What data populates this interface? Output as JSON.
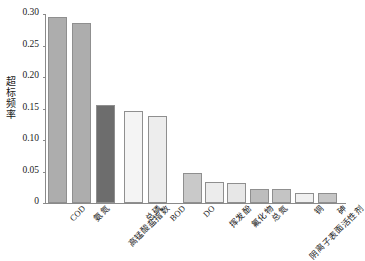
{
  "chart_data": {
    "type": "bar",
    "title": "",
    "xlabel": "",
    "ylabel": "超标频率",
    "ylim": [
      0,
      0.3
    ],
    "grid": false,
    "legend": "none",
    "ytick_labels": [
      "0.30",
      "0.25",
      "0.20",
      "0.15",
      "0.10",
      "0.05",
      "0"
    ],
    "ytick_values": [
      0.3,
      0.25,
      0.2,
      0.15,
      0.1,
      0.05,
      0
    ],
    "categories": [
      "COD",
      "氨氮",
      "高锰酸盐指数",
      "总磷",
      "BOD",
      "DO",
      "挥发酚",
      "氟化物",
      "总氮",
      "阴离子表面活性剂",
      "铜",
      "砷"
    ],
    "values": [
      0.295,
      0.286,
      0.156,
      0.146,
      0.138,
      0.047,
      0.034,
      0.031,
      0.022,
      0.022,
      0.016,
      0.016
    ],
    "bar_colors": [
      "#adadad",
      "#adadad",
      "#6d6d6d",
      "#f4f4f4",
      "#ededed",
      "#c9c9c9",
      "#ececec",
      "#e7e7e7",
      "#bdbdbd",
      "#c4c4c4",
      "#f0f0f0",
      "#c6c6c6"
    ],
    "bar_edge_color": "#8f8f8f",
    "axis_color": "#8a8a8a",
    "text_color": "#1a1a1a",
    "background": "#ffffff"
  }
}
